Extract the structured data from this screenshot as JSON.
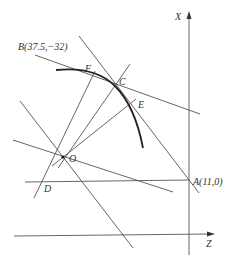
{
  "diagram": {
    "axes": {
      "x_label": "X",
      "z_label": "Z"
    },
    "points": {
      "B": {
        "label": "B(37.5,−32)"
      },
      "A": {
        "label": "A(11,0)"
      },
      "O": {
        "label": "O"
      },
      "C": {
        "label": "C"
      },
      "E": {
        "label": "E"
      },
      "F": {
        "label": "F"
      },
      "D": {
        "label": "D"
      }
    },
    "colors": {
      "line": "#555555",
      "arc": "#222222",
      "text": "#333333"
    }
  }
}
